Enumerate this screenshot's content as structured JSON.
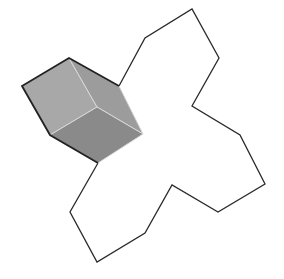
{
  "figure": {
    "colors": {
      "outline": "#2a2a2a",
      "cube_left_face": "#a6a6a6",
      "cube_right_face": "#9a9a9a",
      "cube_bottom_face": "#8a8a8a",
      "cube_edge_highlight": "#d9d9d9",
      "background": "#ffffff"
    },
    "outline_points": "119,86 145,38 192,9 219,58 192,106 240,135 265,184 218,212 172,185 145,233 97,262 70,212 98,163",
    "cube": {
      "top_face": "69,58 22,86 50,135 97,107",
      "right_face": "69,58 119,86 143,134 97,107",
      "bottom_face": "50,135 97,107 143,134 98,163",
      "outer_edge": "119,86 69,58 22,86 50,135 98,163"
    }
  }
}
